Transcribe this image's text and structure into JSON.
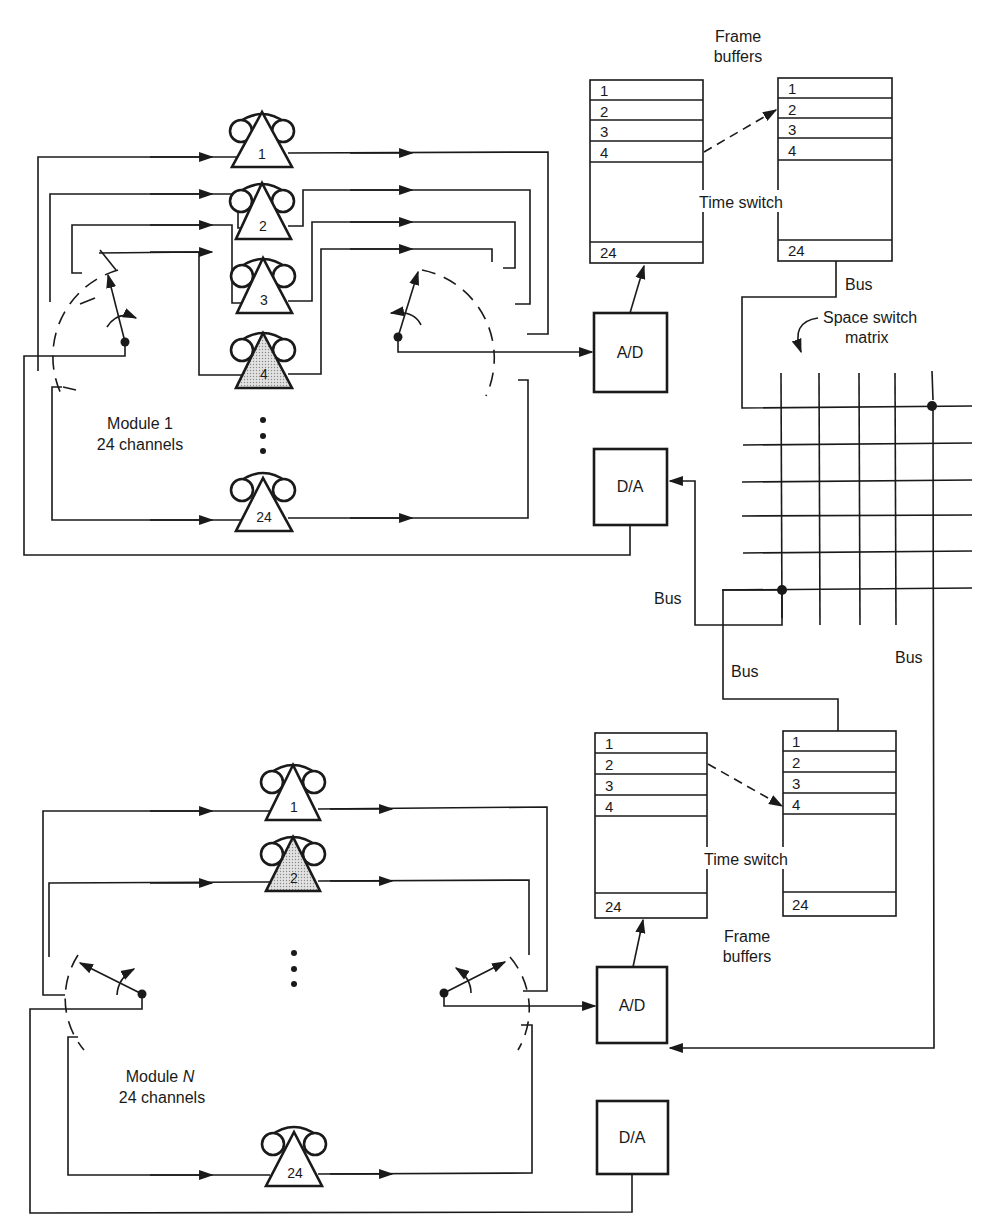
{
  "diagram": {
    "top_frame_buffers_label": [
      "Frame",
      "buffers"
    ],
    "bottom_frame_buffers_label": [
      "Frame",
      "buffers"
    ],
    "time_switch_label": "Time switch",
    "space_switch_label": [
      "Space switch",
      "matrix"
    ],
    "bus_label": "Bus",
    "ad_label": "A/D",
    "da_label": "D/A",
    "dots": "⋮",
    "module_1": {
      "name": "Module 1",
      "channels_label": "24 channels",
      "phones": [
        {
          "num": "1",
          "highlight": false
        },
        {
          "num": "2",
          "highlight": false
        },
        {
          "num": "3",
          "highlight": false
        },
        {
          "num": "4",
          "highlight": true
        },
        {
          "num": "24",
          "highlight": false
        }
      ]
    },
    "module_n": {
      "name_prefix": "Module ",
      "name_var": "N",
      "channels_label": "24 channels",
      "phones": [
        {
          "num": "1",
          "highlight": false
        },
        {
          "num": "2",
          "highlight": true
        },
        {
          "num": "24",
          "highlight": false
        }
      ]
    },
    "buffer_slots": [
      "1",
      "2",
      "3",
      "4",
      "24"
    ],
    "top_time_switch_mapping": {
      "from_slot": "4",
      "to_slot": "2"
    },
    "bottom_time_switch_mapping": {
      "from_slot": "2",
      "to_slot": "4"
    },
    "colors": {
      "line": "#1a1a1a",
      "highlight_fill": "#cfcfcf",
      "background": "#ffffff"
    }
  }
}
